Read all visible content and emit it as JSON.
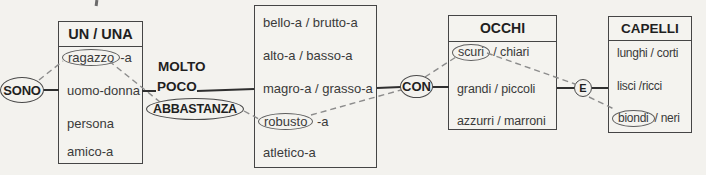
{
  "palette": {
    "paper": "#f3f2ee",
    "ink": "#1f1f1f",
    "item_ink": "#3a3a3a",
    "box_border": "#454545",
    "solid_line": "#2f2f2f",
    "dashed_line": "#8c8c8c"
  },
  "nodes": {
    "sono": {
      "label": "SONO"
    },
    "molto": {
      "label": "MOLTO"
    },
    "poco": {
      "label": "POCO"
    },
    "abbastanza": {
      "label": "ABBASTANZA"
    },
    "con": {
      "label": "CON"
    },
    "e": {
      "label": "E"
    }
  },
  "boxes": {
    "articles": {
      "title": "UN / UNA",
      "items": [
        {
          "circled": "ragazzo",
          "rest": "-a"
        },
        {
          "text": "uomo-donna"
        },
        {
          "text": "persona"
        },
        {
          "text": "amico-a"
        }
      ]
    },
    "adjectives": {
      "items": [
        {
          "text": "bello-a / brutto-a"
        },
        {
          "text": "alto-a / basso-a"
        },
        {
          "text": "magro-a / grasso-a"
        },
        {
          "circled": "robusto",
          "rest": " -a"
        },
        {
          "text": "atletico-a"
        }
      ]
    },
    "occhi": {
      "title": "OCCHI",
      "items": [
        {
          "circled": "scuri",
          "rest": " / chiari"
        },
        {
          "text": "grandi / piccoli"
        },
        {
          "text": "azzurri / marroni"
        }
      ]
    },
    "capelli": {
      "title": "CAPELLI",
      "items": [
        {
          "text": "lunghi / corti"
        },
        {
          "text": "lisci /ricci"
        },
        {
          "circled": "biondi",
          "rest": "/ neri"
        }
      ]
    }
  },
  "connections": {
    "solid": [
      {
        "from": [
          43,
          90
        ],
        "to": [
          59,
          90
        ]
      },
      {
        "from": [
          142,
          91
        ],
        "to": [
          156,
          91
        ]
      },
      {
        "from": [
          197,
          91
        ],
        "to": [
          254,
          89
        ]
      },
      {
        "from": [
          377,
          88
        ],
        "to": [
          401,
          87
        ]
      },
      {
        "from": [
          432,
          87
        ],
        "to": [
          449,
          87
        ]
      },
      {
        "from": [
          557,
          88
        ],
        "to": [
          575,
          88
        ]
      },
      {
        "from": [
          592,
          88
        ],
        "to": [
          608,
          88
        ]
      }
    ],
    "dashed": [
      {
        "from": [
          39,
          80
        ],
        "to": [
          63,
          61
        ]
      },
      {
        "from": [
          109,
          61
        ],
        "to": [
          160,
          102
        ]
      },
      {
        "from": [
          244,
          111
        ],
        "to": [
          259,
          119
        ]
      },
      {
        "from": [
          311,
          115
        ],
        "to": [
          401,
          90
        ]
      },
      {
        "from": [
          425,
          77
        ],
        "to": [
          456,
          57
        ]
      },
      {
        "from": [
          487,
          53
        ],
        "to": [
          575,
          84
        ]
      },
      {
        "from": [
          589,
          97
        ],
        "to": [
          614,
          109
        ]
      }
    ]
  }
}
